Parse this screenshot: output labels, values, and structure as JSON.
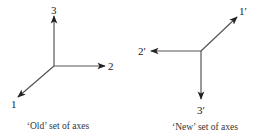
{
  "old_axes": {
    "caption": "‘Old’ set of axes",
    "labels": {
      "axis1": "1",
      "axis2": "2",
      "axis3": "3"
    }
  },
  "new_axes": {
    "caption": "‘New’ set of axes",
    "labels": {
      "axis1": "1′",
      "axis2": "2′",
      "axis3": "3′"
    }
  },
  "colors": {
    "line": "#555555",
    "arrowhead": "#222222",
    "text": "#222222"
  }
}
